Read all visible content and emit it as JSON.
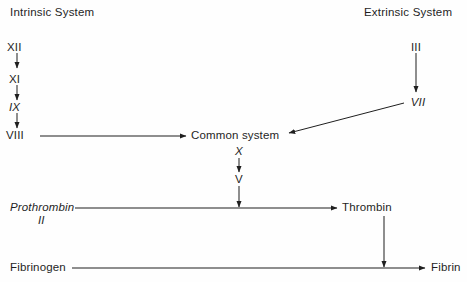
{
  "diagram": {
    "ink_color": "#1f1f1f",
    "background_color": "#fefefe",
    "headings": {
      "intrinsic": "Intrinsic System",
      "extrinsic": "Extrinsic System"
    },
    "nodes": {
      "factor_xii": "XII",
      "factor_xi": "XI",
      "factor_ix": "IX",
      "factor_viii": "VIII",
      "factor_iii": "III",
      "factor_vii": "VII",
      "common_system": "Common system",
      "factor_x": "X",
      "factor_v": "V",
      "prothrombin": "Prothrombin",
      "prothrombin_numeral": "II",
      "thrombin": "Thrombin",
      "fibrinogen": "Fibrinogen",
      "fibrin": "Fibrin"
    }
  }
}
